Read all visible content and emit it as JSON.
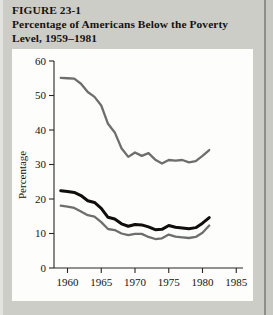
{
  "figure": {
    "number_label": "FIGURE 23-1",
    "title_line1": "Percentage of Americans Below the Poverty",
    "title_line2": "Level, 1959–1981"
  },
  "chart_data": {
    "type": "line",
    "title": "Percentage of Americans Below the Poverty Level, 1959–1981",
    "xlabel": "",
    "ylabel": "Percentage",
    "xlim": [
      1958,
      1986
    ],
    "ylim": [
      0,
      60
    ],
    "yticks": [
      0,
      10,
      20,
      30,
      40,
      50,
      60
    ],
    "ytick_labels": [
      "0",
      "10",
      "20",
      "30",
      "40",
      "50",
      "60"
    ],
    "xticks": [
      1960,
      1965,
      1970,
      1975,
      1980,
      1985
    ],
    "xtick_labels": [
      "1960",
      "1965",
      "1970",
      "1975",
      "1980",
      "1985"
    ],
    "grid": false,
    "legend": "none",
    "x": [
      1959,
      1960,
      1961,
      1962,
      1963,
      1964,
      1965,
      1966,
      1967,
      1968,
      1969,
      1970,
      1971,
      1972,
      1973,
      1974,
      1975,
      1976,
      1977,
      1978,
      1979,
      1980,
      1981
    ],
    "series": [
      {
        "name": "upper-gray-line",
        "color": "#6e6e6e",
        "values": [
          55.1,
          55.0,
          54.9,
          53.4,
          51.0,
          49.6,
          47.1,
          41.8,
          39.3,
          34.7,
          32.2,
          33.5,
          32.5,
          33.3,
          31.4,
          30.3,
          31.3,
          31.1,
          31.3,
          30.6,
          31.0,
          32.5,
          34.2
        ]
      },
      {
        "name": "middle-black-line",
        "color": "#100d0b",
        "values": [
          22.4,
          22.2,
          21.9,
          21.0,
          19.5,
          19.0,
          17.3,
          14.7,
          14.2,
          12.8,
          12.1,
          12.6,
          12.5,
          11.9,
          11.1,
          11.2,
          12.3,
          11.8,
          11.6,
          11.4,
          11.7,
          13.0,
          14.6
        ]
      },
      {
        "name": "lower-gray-line",
        "color": "#6e6e6e",
        "values": [
          18.1,
          17.8,
          17.4,
          16.4,
          15.3,
          14.9,
          13.3,
          11.3,
          11.0,
          10.0,
          9.5,
          9.9,
          9.9,
          9.0,
          8.4,
          8.6,
          9.7,
          9.1,
          8.9,
          8.7,
          9.0,
          10.2,
          12.3
        ]
      }
    ]
  }
}
